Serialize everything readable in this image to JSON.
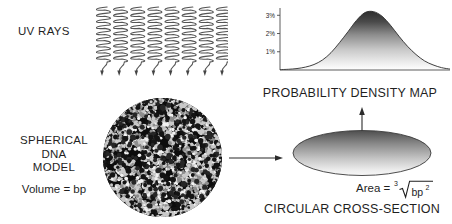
{
  "figure": {
    "width": 452,
    "height": 224,
    "background": "#ffffff",
    "ink_color": "#1f1f1f"
  },
  "uv": {
    "label": "UV RAYS",
    "ray_count": 8,
    "ray_color": "#555555"
  },
  "sphere": {
    "caption_line1": "SPHERICAL",
    "caption_line2": "DNA",
    "caption_line3": "MODEL",
    "volume_formula": "Volume = bp",
    "fill_dark": "#111111",
    "fill_light": "#c9c9c9"
  },
  "arrow": {
    "name": "transform-arrow",
    "color": "#2b2b2b"
  },
  "cross_section": {
    "caption": "CIRCULAR CROSS-SECTION",
    "area_label": "Area =",
    "radical_index": "3",
    "radicand_base": "bp",
    "radicand_exponent": "2",
    "ellipse_top_color": "#5a5a5a",
    "ellipse_bottom_color": "#f0f0f0"
  },
  "chart_data": {
    "type": "area",
    "title": "PROBABILITY DENSITY MAP",
    "xlabel": "",
    "ylabel": "",
    "grid": false,
    "legend": null,
    "ytick_labels": [
      "1%",
      "2%",
      "3%"
    ],
    "ytick_values": [
      1,
      2,
      3
    ],
    "ylim": [
      0,
      3.4
    ],
    "xlim": [
      0,
      100
    ],
    "fill_peak_color": "#3a3a3a",
    "fill_base_color": "#ffffff",
    "line_color": "#2b2b2b",
    "x": [
      0,
      5,
      10,
      15,
      20,
      25,
      30,
      35,
      40,
      45,
      50,
      55,
      60,
      65,
      70,
      75,
      80,
      85,
      90,
      95,
      100
    ],
    "values": [
      0.02,
      0.04,
      0.08,
      0.16,
      0.3,
      0.55,
      0.95,
      1.5,
      2.1,
      2.72,
      3.15,
      3.2,
      2.95,
      2.45,
      1.85,
      1.3,
      0.85,
      0.5,
      0.28,
      0.13,
      0.05
    ]
  }
}
